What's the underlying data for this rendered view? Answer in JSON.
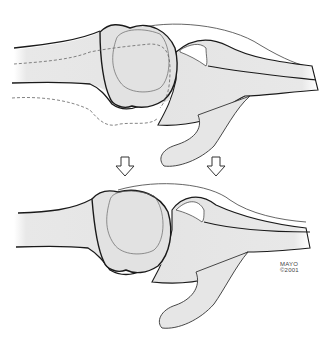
{
  "diagram": {
    "panels": [
      {
        "id": "top",
        "label": "before",
        "features": [
          "bone-shaft-left",
          "bone-head",
          "dashed-displaced-outline",
          "socket-bone",
          "hook-process",
          "capsule-line"
        ]
      },
      {
        "id": "bottom",
        "label": "after",
        "features": [
          "bone-shaft-left",
          "bone-head",
          "socket-bone",
          "hook-process",
          "capsule-line"
        ]
      }
    ],
    "arrows": [
      {
        "direction": "down",
        "x": 125,
        "y": 165
      },
      {
        "direction": "down",
        "x": 216,
        "y": 165
      }
    ],
    "colors": {
      "bone_fill": "#e6e6e6",
      "outline": "#1a1a1a",
      "thin_line": "#555555",
      "background": "#ffffff"
    }
  },
  "credit": {
    "line1": "MAYO",
    "line2": "©2001"
  }
}
